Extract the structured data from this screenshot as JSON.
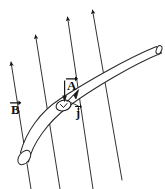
{
  "figure": {
    "caption": "",
    "background_color": "#ffffff",
    "ink_color": "#1a1a1a",
    "width": 165,
    "height": 189
  },
  "labels": {
    "area_vector": {
      "symbol": "A",
      "name": "area-vector-label",
      "accent": "arrow"
    },
    "field_vector": {
      "symbol": "B",
      "name": "magnetic-field-label",
      "accent": "arrow"
    },
    "current_density_vector": {
      "symbol": "j",
      "name": "current-density-label",
      "accent": "arrow"
    }
  },
  "elements": {
    "conductor": {
      "name": "curved-conductor-tube",
      "description": "curved cylindrical wire running lower-left to upper-right"
    },
    "end_cap_left": {
      "name": "conductor-left-end-ellipse"
    },
    "end_cap_right": {
      "name": "conductor-right-end-ellipse"
    },
    "cross_section": {
      "name": "cross-section-ellipse",
      "description": "small ellipse marking the cross-sectional area A"
    },
    "area_arrow": {
      "name": "area-vector-arrow",
      "direction": "down"
    },
    "current_arrow": {
      "name": "current-density-arrow",
      "direction": "up-right",
      "filled": true
    },
    "j_leader": {
      "name": "current-density-leader-line"
    }
  },
  "field_lines": [
    {
      "name": "field-line-1",
      "x1": 10.5,
      "y1": 61.5,
      "x2": 31,
      "y2": 189
    },
    {
      "name": "field-line-2",
      "x1": 35,
      "y1": 34.5,
      "x2": 60,
      "y2": 189
    },
    {
      "name": "field-line-3",
      "x1": 67,
      "y1": 16.5,
      "x2": 93,
      "y2": 189
    },
    {
      "name": "field-line-4",
      "x1": 92,
      "y1": 9.5,
      "x2": 122,
      "y2": 180
    }
  ]
}
